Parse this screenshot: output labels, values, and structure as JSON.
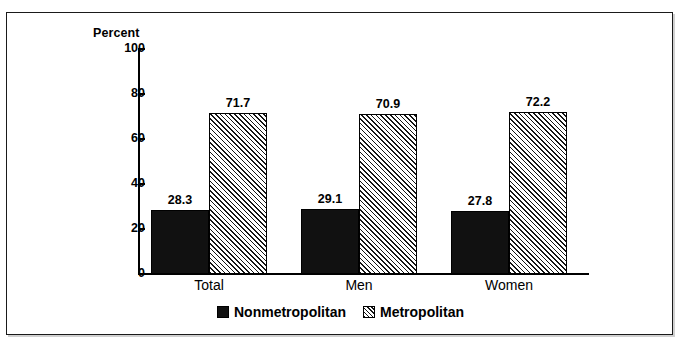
{
  "chart_data": {
    "type": "bar",
    "title": "",
    "xlabel": "",
    "ylabel": "Percent",
    "ylim": [
      0,
      100
    ],
    "yticks": [
      0,
      20,
      40,
      60,
      80,
      100
    ],
    "ytick_labels": [
      "0",
      "20",
      "40",
      "60",
      "80",
      "100"
    ],
    "grid": false,
    "legend_position": "bottom-center",
    "categories": [
      "Total",
      "Men",
      "Women"
    ],
    "series": [
      {
        "name": "Nonmetropolitan",
        "values": [
          28.3,
          29.1,
          27.8
        ],
        "value_labels": [
          "28.3",
          "29.1",
          "27.8"
        ],
        "fill": "solid-black",
        "color": "#111111"
      },
      {
        "name": "Metropolitan",
        "values": [
          71.7,
          70.9,
          72.2
        ],
        "value_labels": [
          "71.7",
          "70.9",
          "72.2"
        ],
        "fill": "diagonal-hatch",
        "color": "#f2f2f2"
      }
    ]
  },
  "axis": {
    "y_title": "Percent"
  },
  "legend": {
    "items": [
      {
        "label": "Nonmetropolitan",
        "swatch": "solid-black-swatch"
      },
      {
        "label": "Metropolitan",
        "swatch": "hatched-swatch"
      }
    ]
  },
  "caption_fragment": ""
}
